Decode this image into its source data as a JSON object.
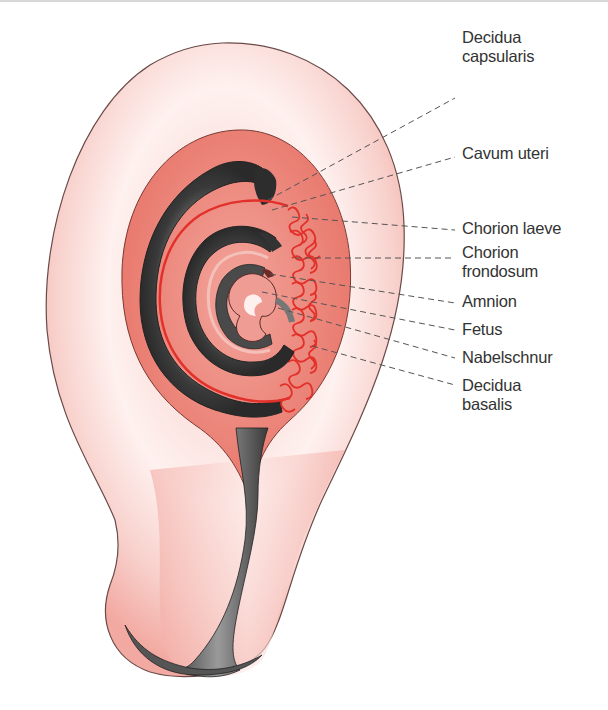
{
  "figure": {
    "labels": [
      {
        "id": "decidua-capsularis",
        "lines": [
          "Decidua",
          "capsularis"
        ],
        "top": 30
      },
      {
        "id": "cavum-uteri",
        "lines": [
          "Cavum uteri"
        ],
        "top": 145
      },
      {
        "id": "chorion-laeve",
        "lines": [
          "Chorion laeve"
        ],
        "top": 219
      },
      {
        "id": "chorion-frondosum",
        "lines": [
          "Chorion",
          "frondosum"
        ],
        "top": 242
      },
      {
        "id": "amnion",
        "lines": [
          "Amnion"
        ],
        "top": 291
      },
      {
        "id": "fetus",
        "lines": [
          "Fetus"
        ],
        "top": 318
      },
      {
        "id": "nabelschnur",
        "lines": [
          "Nabelschnur"
        ],
        "top": 346
      },
      {
        "id": "decidua-basalis",
        "lines": [
          "Decidua",
          "basalis"
        ],
        "top": 373
      }
    ],
    "colors": {
      "myometrium": "#f0a49c",
      "myometrium_light": "#fde9e6",
      "decidua": "#e8786a",
      "dark_tissue": "#3c3c3c",
      "villi": "#e8342a",
      "leader_line": "#555555",
      "text": "#333333"
    }
  }
}
